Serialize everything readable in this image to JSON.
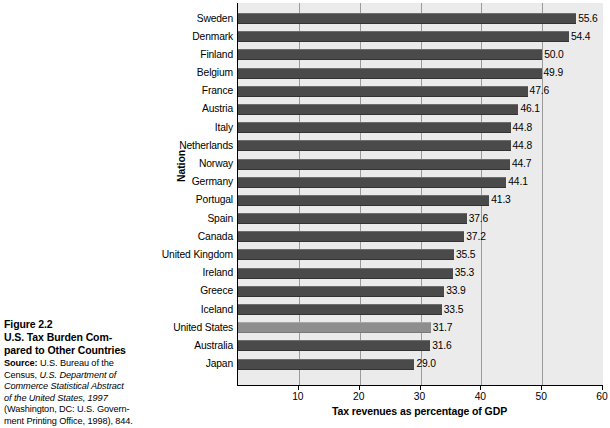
{
  "caption": {
    "figure_number": "Figure 2.2",
    "title_line1": "U.S. Tax Burden Com-",
    "title_line2": "pared to Other Countries",
    "source_label": "Source:",
    "source_line1": " U.S. Bureau of the",
    "source_line2_plain": "Census, ",
    "source_line2_italic": "U.S. Department of",
    "source_line3_italic": "Commerce Statistical Abstract",
    "source_line4_italic": "of the United States, 1997",
    "source_line5": "(Washington, DC: U.S. Govern-",
    "source_line6": "ment Printing Office, 1998), 844."
  },
  "chart_data": {
    "type": "bar",
    "orientation": "horizontal",
    "title": "",
    "xlabel": "Tax revenues as percentage of GDP",
    "ylabel": "Nation",
    "xlim": [
      0,
      60
    ],
    "xticks": [
      10,
      20,
      30,
      40,
      50,
      60
    ],
    "grid": true,
    "legend": "none",
    "highlight_category": "United States",
    "colors": {
      "bar": "#4a4a4a",
      "bar_highlight": "#8e8e8e",
      "plot_background": "#ebebeb",
      "gridline": "#9a9a9a",
      "axis": "#000000"
    },
    "categories": [
      "Sweden",
      "Denmark",
      "Finland",
      "Belgium",
      "France",
      "Austria",
      "Italy",
      "Netherlands",
      "Norway",
      "Germany",
      "Portugal",
      "Spain",
      "Canada",
      "United Kingdom",
      "Ireland",
      "Greece",
      "Iceland",
      "United States",
      "Australia",
      "Japan"
    ],
    "values": [
      55.6,
      54.4,
      50.0,
      49.9,
      47.6,
      46.1,
      44.8,
      44.8,
      44.7,
      44.1,
      41.3,
      37.6,
      37.2,
      35.5,
      35.3,
      33.9,
      33.5,
      31.7,
      31.6,
      29.0
    ],
    "value_labels": [
      "55.6",
      "54.4",
      "50.0",
      "49.9",
      "47.6",
      "46.1",
      "44.8",
      "44.8",
      "44.7",
      "44.1",
      "41.3",
      "37.6",
      "37.2",
      "35.5",
      "35.3",
      "33.9",
      "33.5",
      "31.7",
      "31.6",
      "29.0"
    ]
  }
}
